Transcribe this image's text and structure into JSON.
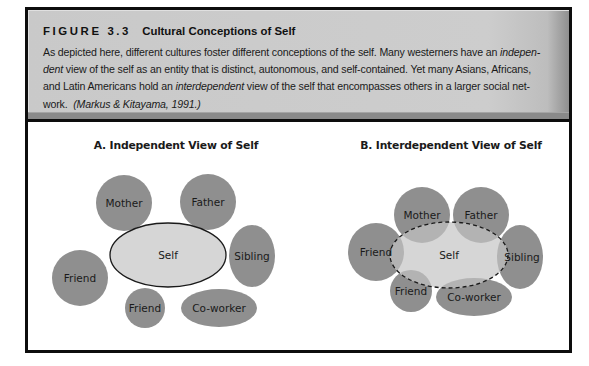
{
  "figure": {
    "label": "FIGURE 3.3",
    "title": "Cultural Conceptions of Self",
    "caption": {
      "line1_pre": "As depicted here, different cultures foster different conceptions of the self. Many westerners have an ",
      "line1_italic": "indepen-",
      "line2_italic": "dent",
      "line2_post": " view of the self as an entity that is distinct, autonomous, and self-contained. Yet many Asians, Africans,",
      "line3_pre": "and Latin Americans hold an ",
      "line3_italic": "interdependent",
      "line3_post": " view of the self that encompasses others in a larger social net-",
      "line4_pre": "work. ",
      "line4_citation": "(Markus & Kitayama, 1991.)"
    }
  },
  "colors": {
    "other_fill": "#8f8f8f",
    "self_fill": "#d6d6d6",
    "overlap_fill": "#b3b3b3",
    "outline": "#1a1a1a",
    "caption_bg": "#cbcbcb"
  },
  "diagrams": {
    "independent": {
      "title": "A. Independent View of Self",
      "self": {
        "label": "Self",
        "cx": 140,
        "cy": 133,
        "rx": 58,
        "ry": 32
      },
      "others": [
        {
          "label": "Mother",
          "cx": 96,
          "cy": 81,
          "rx": 28,
          "ry": 28
        },
        {
          "label": "Father",
          "cx": 180,
          "cy": 80,
          "rx": 28,
          "ry": 28
        },
        {
          "label": "Sibling",
          "cx": 224,
          "cy": 134,
          "rx": 23,
          "ry": 31
        },
        {
          "label": "Friend",
          "cx": 52,
          "cy": 156,
          "rx": 28,
          "ry": 28
        },
        {
          "label": "Friend",
          "cx": 117,
          "cy": 186,
          "rx": 20,
          "ry": 20
        },
        {
          "label": "Co-worker",
          "cx": 191,
          "cy": 186,
          "rx": 38,
          "ry": 19
        }
      ]
    },
    "interdependent": {
      "title": "B. Interdependent View of Self",
      "self": {
        "label": "Self",
        "cx": 421,
        "cy": 133,
        "rx": 59,
        "ry": 33
      },
      "others": [
        {
          "label": "Mother",
          "cx": 394,
          "cy": 93,
          "rx": 28,
          "ry": 28
        },
        {
          "label": "Father",
          "cx": 453,
          "cy": 93,
          "rx": 28,
          "ry": 28
        },
        {
          "label": "Friend",
          "cx": 348,
          "cy": 130,
          "rx": 28,
          "ry": 29
        },
        {
          "label": "Sibling",
          "cx": 492,
          "cy": 135,
          "rx": 23,
          "ry": 32
        },
        {
          "label": "Friend",
          "cx": 383,
          "cy": 169,
          "rx": 21,
          "ry": 21
        },
        {
          "label": "Co-worker",
          "cx": 446,
          "cy": 175,
          "rx": 38,
          "ry": 19
        }
      ]
    }
  }
}
